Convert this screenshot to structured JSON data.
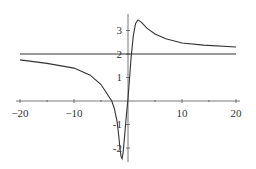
{
  "chart_data": {
    "type": "line",
    "title": "",
    "xlabel": "",
    "ylabel": "",
    "xlim": [
      -20,
      20
    ],
    "ylim": [
      -2.5,
      3.5
    ],
    "grid": false,
    "legend": null,
    "x_ticks": [
      "-20",
      "-10",
      "10",
      "20"
    ],
    "y_ticks": [
      "-2",
      "-1",
      "1",
      "2",
      "3"
    ],
    "series": [
      {
        "name": "f(x)",
        "x": [
          -20,
          -15,
          -10,
          -7,
          -5,
          -4,
          -3,
          -2.5,
          -2,
          -1.7,
          -1.5,
          -1.3,
          -1.1,
          -0.9,
          -0.6,
          -0.3,
          0,
          0.3,
          0.6,
          1.0,
          1.4,
          1.85,
          2.5,
          3.5,
          5,
          7,
          10,
          14,
          20
        ],
        "values": [
          1.75,
          1.6,
          1.4,
          1.1,
          0.7,
          0.35,
          0.0,
          -0.35,
          -0.9,
          -1.5,
          -2.0,
          -2.35,
          -2.45,
          -2.2,
          -1.4,
          -0.6,
          0.1,
          1.0,
          1.9,
          2.8,
          3.3,
          3.45,
          3.35,
          3.1,
          2.85,
          2.65,
          2.47,
          2.38,
          2.3
        ]
      },
      {
        "name": "y = 2",
        "x": [
          -20,
          20
        ],
        "values": [
          2,
          2
        ]
      }
    ]
  },
  "labels": {
    "x_neg20": "−20",
    "x_neg10": "−10",
    "x_10": "10",
    "x_20": "20",
    "y_3": "3",
    "y_2": "2",
    "y_1": "1",
    "y_neg1": "-1",
    "y_neg2": "-2"
  }
}
